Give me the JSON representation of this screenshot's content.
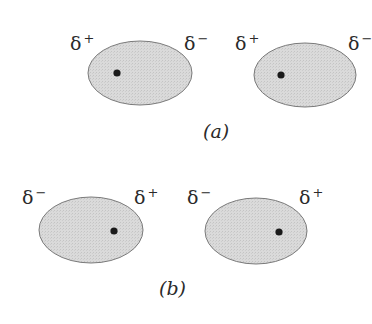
{
  "panels": [
    {
      "caption": "(a)",
      "molecules": [
        {
          "left_label": "δ",
          "left_sign": "+",
          "right_label": "δ",
          "right_sign": "−",
          "nucleus_side": "left"
        },
        {
          "left_label": "δ",
          "left_sign": "+",
          "right_label": "δ",
          "right_sign": "−",
          "nucleus_side": "left"
        }
      ]
    },
    {
      "caption": "(b)",
      "molecules": [
        {
          "left_label": "δ",
          "left_sign": "−",
          "right_label": "δ",
          "right_sign": "+",
          "nucleus_side": "right"
        },
        {
          "left_label": "δ",
          "left_sign": "−",
          "right_label": "δ",
          "right_sign": "+",
          "nucleus_side": "right"
        }
      ]
    }
  ],
  "colors": {
    "cloud_fill": "#d9d9d9",
    "cloud_stroke": "#7a7a7a",
    "nucleus": "#1a1a1a"
  }
}
